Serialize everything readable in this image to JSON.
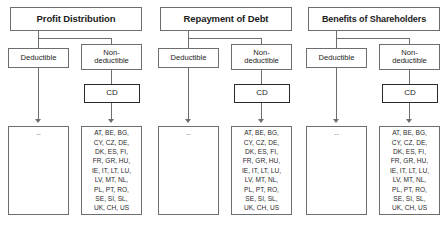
{
  "diagram": {
    "columns": [
      {
        "title": "Profit Distribution",
        "deductible_label": "Deductible",
        "nondeductible_label_line1": "Non-",
        "nondeductible_label_line2": "deductible",
        "cd_label": "CD",
        "deductible_result": "--",
        "nondeductible_result_lines": [
          "AT, BE, BG,",
          "CY, CZ, DE,",
          "DK, ES, FI,",
          "FR, GR, HU,",
          "IE, IT, LT, LU,",
          "LV, MT, NL,",
          "PL, PT, RO,",
          "SE, SI, SL,",
          "UK, CH, US"
        ]
      },
      {
        "title": "Repayment of Debt",
        "deductible_label": "Deductible",
        "nondeductible_label_line1": "Non-",
        "nondeductible_label_line2": "deductible",
        "cd_label": "CD",
        "deductible_result": "--",
        "nondeductible_result_lines": [
          "AT, BE, BG,",
          "CY, CZ, DE,",
          "DK, ES, FI,",
          "FR, GR, HU,",
          "IE, IT, LT, LU,",
          "LV, MT, NL,",
          "PL, PT, RO,",
          "SE, SI, SL,",
          "UK, CH, US"
        ]
      },
      {
        "title": "Benefits of Shareholders",
        "deductible_label": "Deductible",
        "nondeductible_label_line1": "Non-",
        "nondeductible_label_line2": "deductible",
        "cd_label": "CD",
        "deductible_result": "--",
        "nondeductible_result_lines": [
          "AT, BE, BG,",
          "CY, CZ, DE,",
          "DK, ES, FI,",
          "FR, GR, HU,",
          "IE, IT, LT, LU,",
          "LV, MT, NL,",
          "PL, PT, RO,",
          "SE, SI, SL,",
          "UK, CH, US"
        ]
      }
    ],
    "colors": {
      "border": "#6e6e6e",
      "emphasis_border": "#2a2a2a",
      "text": "#1c1c1c",
      "muted_text": "#8f8f8f",
      "background": "#ffffff"
    }
  }
}
